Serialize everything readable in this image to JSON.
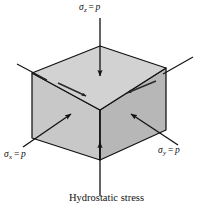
{
  "figure": {
    "caption": "Hydrostatic stress",
    "background_color": "#ffffff",
    "stroke_color": "#111111"
  },
  "labels": {
    "top": {
      "symbol": "σ",
      "subscript": "z",
      "equals": "=",
      "value": "p",
      "full_text": "σz = p"
    },
    "left": {
      "symbol": "σ",
      "subscript": "x",
      "equals": "=",
      "value": "p",
      "full_text": "σx = p"
    },
    "right": {
      "symbol": "σ",
      "subscript": "y",
      "equals": "=",
      "value": "p",
      "full_text": "σy = p"
    }
  },
  "cube": {
    "top_face_color": "#d2d2d2",
    "left_face_color": "#c8c8c8",
    "right_face_color": "#b7b7b7",
    "edge_color": "#111111",
    "vertices": {
      "top": [
        100,
        46
      ],
      "left_top": [
        32,
        73
      ],
      "front_top": [
        100,
        110
      ],
      "right_top": [
        166,
        68
      ],
      "left_bottom": [
        32,
        138
      ],
      "front_bottom": [
        100,
        160
      ],
      "right_bottom": [
        166,
        130
      ]
    }
  },
  "arrows": {
    "z_top": {
      "name": "sigma-z-arrow",
      "direction": "down",
      "from": [
        100,
        18
      ],
      "to": [
        100,
        75
      ]
    },
    "z_bottom": {
      "name": "sigma-z-bottom-arrow",
      "direction": "up",
      "from": [
        100,
        195
      ],
      "to": [
        100,
        142
      ]
    },
    "x_left": {
      "name": "sigma-x-arrow",
      "direction": "up-right",
      "from": [
        24,
        146
      ],
      "to": [
        70,
        114
      ]
    },
    "y_right": {
      "name": "sigma-y-arrow",
      "direction": "up-left",
      "from": [
        176,
        144
      ],
      "to": [
        132,
        114
      ]
    },
    "top_edge_left": {
      "name": "top-left-edge-arrow",
      "direction": "down-right",
      "from": [
        60,
        84
      ],
      "to": [
        85,
        95
      ]
    },
    "top_edge_right": {
      "name": "top-right-edge-arrow",
      "direction": "down-left",
      "from": [
        155,
        82
      ],
      "to": [
        126,
        93
      ]
    }
  },
  "tick_marks": {
    "upper_left": {
      "name": "upper-left-tick",
      "from": [
        17,
        64
      ],
      "to": [
        47,
        80
      ]
    },
    "upper_right": {
      "name": "upper-right-tick",
      "from": [
        192,
        57
      ],
      "to": [
        162,
        74
      ]
    }
  }
}
